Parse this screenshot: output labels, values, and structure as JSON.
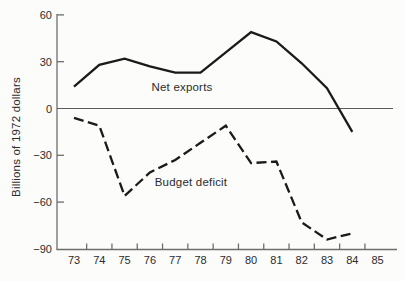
{
  "chart_data": {
    "type": "line",
    "title": "",
    "xlabel": "",
    "ylabel": "Billions of 1972 dollars",
    "ylim": [
      -90,
      60
    ],
    "yticks": [
      60,
      30,
      0,
      -30,
      -60,
      -90
    ],
    "ytick_labels": [
      "60",
      "30",
      "0",
      "−30",
      "−60",
      "−90"
    ],
    "xtick_labels": [
      "73",
      "74",
      "75",
      "76",
      "77",
      "78",
      "79",
      "80",
      "81",
      "82",
      "83",
      "84",
      "85"
    ],
    "x_years": [
      73,
      74,
      75,
      76,
      77,
      78,
      79,
      80,
      81,
      82,
      83,
      84
    ],
    "series": [
      {
        "name": "Net exports",
        "style": "solid",
        "values": [
          14,
          28,
          32,
          27,
          23,
          23,
          36,
          49,
          43,
          29,
          13,
          -15
        ]
      },
      {
        "name": "Budget deficit",
        "style": "dashed",
        "values": [
          -6,
          -11,
          -56,
          -41,
          -33,
          -22,
          -11,
          -35,
          -34,
          -73,
          -84,
          -80
        ]
      }
    ],
    "legend": "inline-labels",
    "grid": false,
    "zero_line": true,
    "colors": {
      "line": "#1a1a1a",
      "axis": "#6e6e6e",
      "zero_line": "#5a5a5a",
      "text": "#2b2b2b",
      "background": "#fcfcfb"
    }
  }
}
